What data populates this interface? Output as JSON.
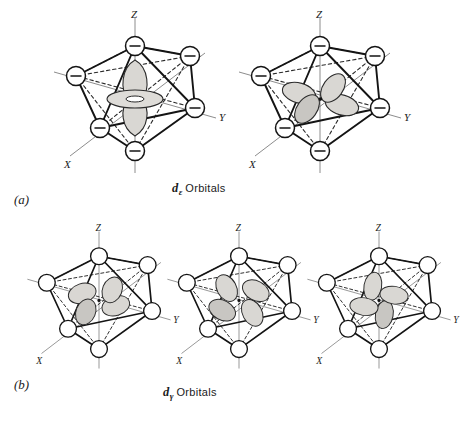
{
  "figure": {
    "type": "crystal-field-orbital-diagram",
    "background_color": "#ffffff",
    "ink_color": "#141414",
    "orbital_fill_color": "#d9d7d3",
    "axis_color": "#6e6e6e"
  },
  "panels": [
    {
      "label": "(a)",
      "caption_symbol": "d",
      "caption_subscript": "ε",
      "caption_text": "Orbitals",
      "caption_full": "dε Orbitals",
      "ligand_charge": "−",
      "ligand_shows_charge": true,
      "diagrams": [
        {
          "orbital": "d-z-squared",
          "axes": {
            "vertical": "Z",
            "right": "Y",
            "left": "X"
          },
          "lobe_count": 2,
          "has_torus": true,
          "lobe_orientation": "along-z"
        },
        {
          "orbital": "d-x2-y2",
          "axes": {
            "vertical": "Z",
            "right": "Y",
            "left": "X"
          },
          "lobe_count": 4,
          "has_torus": false,
          "lobe_orientation": "along-x-and-y"
        }
      ]
    },
    {
      "label": "(b)",
      "caption_symbol": "d",
      "caption_subscript": "γ",
      "caption_text": "Orbitals",
      "caption_full": "dγ Orbitals",
      "ligand_charge": "",
      "ligand_shows_charge": false,
      "diagrams": [
        {
          "orbital": "d-xy",
          "axes": {
            "vertical": "Z",
            "right": "Y",
            "left": "X"
          },
          "lobe_count": 4,
          "has_torus": false,
          "lobe_orientation": "between-x-and-y"
        },
        {
          "orbital": "d-xz",
          "axes": {
            "vertical": "Z",
            "right": "Y",
            "left": "X"
          },
          "lobe_count": 4,
          "has_torus": false,
          "lobe_orientation": "between-x-and-z"
        },
        {
          "orbital": "d-yz",
          "axes": {
            "vertical": "Z",
            "right": "Y",
            "left": "X"
          },
          "lobe_count": 4,
          "has_torus": false,
          "lobe_orientation": "between-y-and-z"
        }
      ]
    }
  ],
  "axis_labels": {
    "z": "Z",
    "y": "Y",
    "x": "X"
  }
}
